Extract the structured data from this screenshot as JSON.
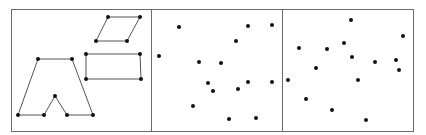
{
  "figure": {
    "colors": {
      "frame": "#6b6b6b",
      "edge": "#555555",
      "point": "#111111",
      "background": "#ffffff"
    },
    "panels": [
      {
        "id": "shapes",
        "kind": "connected-shapes",
        "shapes": [
          {
            "name": "notched-trapezoid",
            "closed": true,
            "points": [
              [
                38,
                59
              ],
              [
                72,
                59
              ],
              [
                93,
                115
              ],
              [
                67,
                115
              ],
              [
                55,
                96
              ],
              [
                44,
                115
              ],
              [
                18,
                115
              ]
            ]
          },
          {
            "name": "parallelogram",
            "closed": true,
            "points": [
              [
                108,
                17
              ],
              [
                140,
                17
              ],
              [
                127,
                41
              ],
              [
                96,
                41
              ]
            ]
          },
          {
            "name": "rectangle",
            "closed": true,
            "points": [
              [
                86,
                54
              ],
              [
                140,
                54
              ],
              [
                141,
                79
              ],
              [
                86,
                79
              ]
            ]
          }
        ]
      },
      {
        "id": "scatter-a",
        "kind": "point-set",
        "points": [
          [
            179,
            27
          ],
          [
            159,
            56
          ],
          [
            199,
            62
          ],
          [
            221,
            63
          ],
          [
            236,
            41
          ],
          [
            248,
            26
          ],
          [
            272,
            25
          ],
          [
            208,
            83
          ],
          [
            213,
            91
          ],
          [
            193,
            106
          ],
          [
            238,
            89
          ],
          [
            248,
            82
          ],
          [
            272,
            82
          ],
          [
            229,
            119
          ],
          [
            256,
            118
          ]
        ]
      },
      {
        "id": "scatter-b",
        "kind": "point-set",
        "points": [
          [
            351,
            20
          ],
          [
            403,
            36
          ],
          [
            299,
            48
          ],
          [
            327,
            49
          ],
          [
            344,
            43
          ],
          [
            352,
            57
          ],
          [
            316,
            68
          ],
          [
            375,
            62
          ],
          [
            396,
            60
          ],
          [
            399,
            70
          ],
          [
            288,
            80
          ],
          [
            358,
            80
          ],
          [
            306,
            99
          ],
          [
            332,
            110
          ],
          [
            366,
            120
          ]
        ]
      }
    ]
  }
}
